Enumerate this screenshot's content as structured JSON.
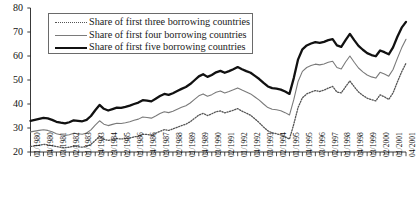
{
  "chart_data": {
    "type": "line",
    "title": "",
    "xlabel": "",
    "ylabel": "",
    "ylim": [
      20,
      80
    ],
    "yticks": [
      20,
      30,
      40,
      50,
      60,
      70,
      80
    ],
    "grid": false,
    "legend_position": "top-left",
    "xtick_step": 3,
    "x": [
      "01/1980",
      "02/1980",
      "03/1980",
      "04/1980",
      "01/1981",
      "02/1981",
      "03/1981",
      "04/1981",
      "01/1982",
      "02/1982",
      "03/1982",
      "04/1982",
      "01/1983",
      "02/1983",
      "03/1983",
      "04/1983",
      "01/1984",
      "02/1984",
      "03/1984",
      "04/1984",
      "01/1985",
      "02/1985",
      "03/1985",
      "04/1985",
      "01/1986",
      "02/1986",
      "03/1986",
      "04/1986",
      "01/1987",
      "02/1987",
      "03/1987",
      "04/1987",
      "01/1988",
      "02/1988",
      "03/1988",
      "04/1988",
      "01/1989",
      "02/1989",
      "03/1989",
      "04/1989",
      "01/1990",
      "02/1990",
      "03/1990",
      "04/1990",
      "01/1991",
      "02/1991",
      "03/1991",
      "04/1991",
      "01/1992",
      "02/1992",
      "03/1992",
      "04/1992",
      "01/1993",
      "02/1993",
      "03/1993",
      "04/1993",
      "01/1994",
      "02/1994",
      "03/1994",
      "04/1994",
      "01/1995",
      "02/1995",
      "03/1995",
      "04/1995",
      "01/1996",
      "02/1996",
      "03/1996",
      "04/1996",
      "01/1997",
      "02/1997",
      "03/1997",
      "04/1997",
      "01/1998",
      "02/1998",
      "03/1998",
      "04/1998",
      "01/1999",
      "02/1999",
      "03/1999",
      "04/1999",
      "01/2000",
      "02/2000",
      "03/2000",
      "04/2000",
      "01/2001",
      "02/2001",
      "03/2001",
      "04/2001"
    ],
    "xticklabels": [
      "01/1980",
      "04/1980",
      "03/1981",
      "02/1982",
      "01/1983",
      "04/1983",
      "03/1984",
      "02/1985",
      "01/1986",
      "04/1986",
      "03/1987",
      "02/1988",
      "01/1989",
      "04/1989",
      "03/1990",
      "02/1991",
      "01/1992",
      "04/1992",
      "03/1993",
      "02/1994",
      "01/1995",
      "04/1995",
      "03/1996",
      "02/1997",
      "01/1998",
      "04/1998",
      "03/1999",
      "02/2000",
      "01/2001",
      "04/2001"
    ],
    "series": [
      {
        "name": "Share of first three borrowing countries",
        "style": "dotted",
        "color": "#555555",
        "width": 1.3,
        "values": [
          22.3,
          22.6,
          22.8,
          23.2,
          23.0,
          22.6,
          22.3,
          22.0,
          21.8,
          22.0,
          22.4,
          22.2,
          22.0,
          22.3,
          23.2,
          24.8,
          26.6,
          25.3,
          24.8,
          25.2,
          25.6,
          25.4,
          25.6,
          25.8,
          26.3,
          26.6,
          27.4,
          27.3,
          27.0,
          27.8,
          28.6,
          29.3,
          29.0,
          29.6,
          30.3,
          31.0,
          31.6,
          32.6,
          34.0,
          35.4,
          36.1,
          35.2,
          35.9,
          36.8,
          37.1,
          36.3,
          36.8,
          37.4,
          38.1,
          37.0,
          36.2,
          35.3,
          33.8,
          32.2,
          30.4,
          28.8,
          28.0,
          27.6,
          27.1,
          26.3,
          25.4,
          31.6,
          38.6,
          42.6,
          44.2,
          45.0,
          45.6,
          45.2,
          45.8,
          46.6,
          47.3,
          45.0,
          44.6,
          47.2,
          49.6,
          47.2,
          45.0,
          43.6,
          42.4,
          41.8,
          41.3,
          43.8,
          43.0,
          41.9,
          44.6,
          49.2,
          53.4,
          57.0
        ]
      },
      {
        "name": "Share of first four borrowing countries",
        "style": "thin",
        "color": "#7a7a7a",
        "width": 1.1,
        "values": [
          28.4,
          28.7,
          29.0,
          29.3,
          29.0,
          28.4,
          27.6,
          27.2,
          26.9,
          27.2,
          27.8,
          27.6,
          27.4,
          27.9,
          29.2,
          31.2,
          33.0,
          31.6,
          31.0,
          31.5,
          32.0,
          31.9,
          32.2,
          32.6,
          33.2,
          33.7,
          34.6,
          34.4,
          34.1,
          35.0,
          36.0,
          36.8,
          36.4,
          37.0,
          37.8,
          38.6,
          39.3,
          40.4,
          41.9,
          43.4,
          44.2,
          43.2,
          43.9,
          44.9,
          45.4,
          44.6,
          45.2,
          45.9,
          46.7,
          45.8,
          45.0,
          44.2,
          42.9,
          41.6,
          40.0,
          38.5,
          37.8,
          37.6,
          37.2,
          36.4,
          35.4,
          41.8,
          49.4,
          53.6,
          55.2,
          56.0,
          56.6,
          56.3,
          56.7,
          57.4,
          57.8,
          55.2,
          54.6,
          57.5,
          60.0,
          57.4,
          55.0,
          53.4,
          52.1,
          51.3,
          50.8,
          53.2,
          52.5,
          51.6,
          54.4,
          59.0,
          63.4,
          67.0
        ]
      },
      {
        "name": "Share of first five borrowing countries",
        "style": "thick",
        "color": "#111111",
        "width": 2.3,
        "values": [
          33.0,
          33.4,
          33.8,
          34.2,
          34.0,
          33.4,
          32.6,
          32.2,
          31.9,
          32.4,
          33.2,
          33.0,
          32.8,
          33.4,
          35.0,
          37.4,
          39.6,
          38.0,
          37.3,
          37.9,
          38.5,
          38.4,
          38.8,
          39.3,
          40.0,
          40.6,
          41.6,
          41.4,
          41.1,
          42.2,
          43.3,
          44.2,
          43.8,
          44.5,
          45.4,
          46.3,
          47.1,
          48.3,
          49.9,
          51.5,
          52.4,
          51.3,
          52.1,
          53.2,
          53.8,
          53.0,
          53.7,
          54.5,
          55.4,
          54.5,
          53.7,
          53.0,
          51.7,
          50.4,
          48.8,
          47.3,
          46.6,
          46.4,
          46.0,
          45.2,
          44.2,
          50.8,
          58.6,
          62.8,
          64.4,
          65.2,
          65.8,
          65.5,
          65.9,
          66.6,
          67.0,
          64.4,
          63.8,
          66.6,
          69.2,
          66.6,
          64.2,
          62.6,
          61.2,
          60.4,
          59.9,
          62.3,
          61.6,
          60.7,
          63.6,
          68.0,
          71.8,
          74.2
        ]
      }
    ]
  },
  "legend": {
    "items": [
      {
        "label": "Share of first three borrowing countries"
      },
      {
        "label": "Share of first four borrowing countries"
      },
      {
        "label": "Share of first five borrowing countries"
      }
    ]
  }
}
